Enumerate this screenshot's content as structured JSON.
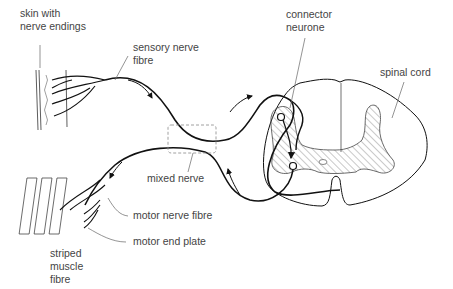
{
  "diagram": {
    "type": "reflex-arc",
    "colors": {
      "line": "#111111",
      "label": "#444444",
      "leader": "#555555",
      "hatch": "#777777",
      "dashed": "#888888"
    },
    "labels": {
      "skin": "skin with\nnerve endings",
      "sensory": "sensory nerve\nfibre",
      "connector": "connector\nneurone",
      "spinal_cord": "spinal cord",
      "mixed_nerve": "mixed nerve",
      "motor_fibre": "motor nerve fibre",
      "end_plate": "motor end plate",
      "muscle": "striped\nmuscle\nfibre"
    }
  }
}
